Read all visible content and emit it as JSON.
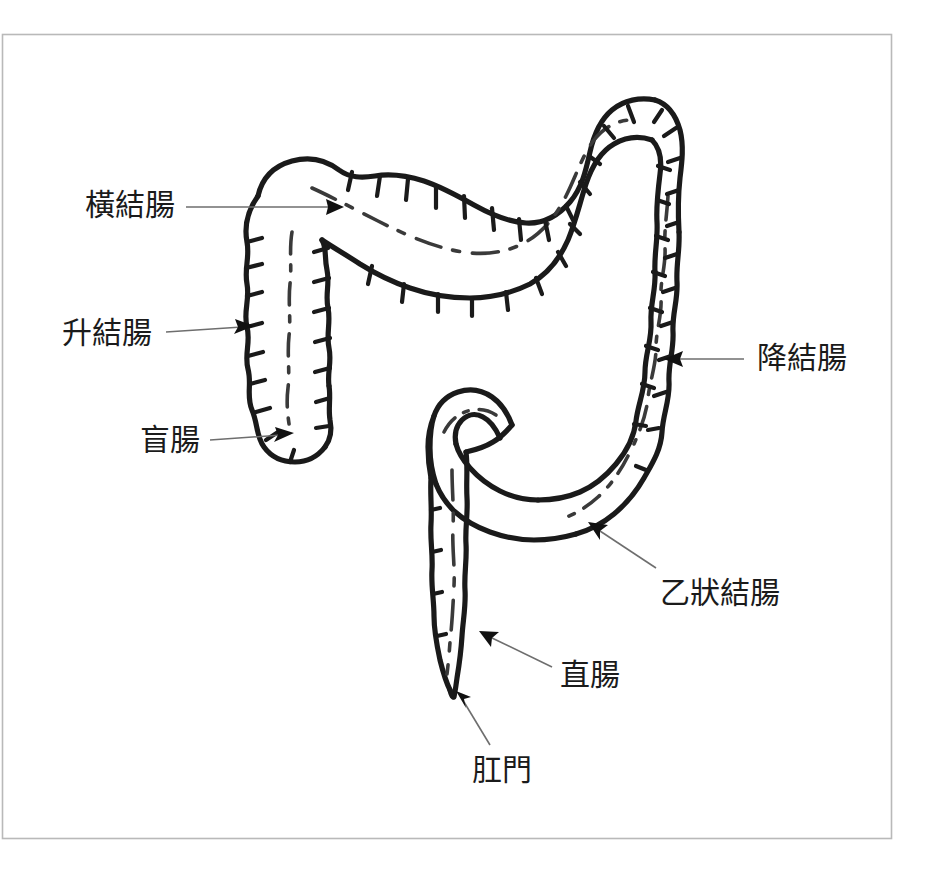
{
  "figure": {
    "title_visible": false,
    "background_color": "#ffffff",
    "frame": {
      "color": "#b9b9b9",
      "x": 2,
      "y": 34,
      "width": 889,
      "height": 804
    },
    "line_color": "#1a1a1a",
    "leader_color": "#6e6e6e",
    "text_color": "#1b1b1b"
  },
  "labels": [
    {
      "id": "transverse-colon",
      "text": "橫結腸",
      "x": 85,
      "y": 190,
      "arrow_from": [
        186,
        207
      ],
      "arrow_to": [
        340,
        207
      ]
    },
    {
      "id": "ascending-colon",
      "text": "升結腸",
      "x": 62,
      "y": 318,
      "arrow_from": [
        166,
        331
      ],
      "arrow_to": [
        248,
        326
      ]
    },
    {
      "id": "cecum",
      "text": "盲腸",
      "x": 140,
      "y": 425,
      "arrow_from": [
        210,
        440
      ],
      "arrow_to": [
        288,
        434
      ]
    },
    {
      "id": "descending-colon",
      "text": "降結腸",
      "x": 757,
      "y": 343,
      "arrow_from": [
        744,
        359
      ],
      "arrow_to": [
        668,
        359
      ]
    },
    {
      "id": "sigmoid-colon",
      "text": "乙狀結腸",
      "x": 660,
      "y": 578,
      "arrow_from": [
        655,
        568
      ],
      "arrow_to": [
        589,
        523
      ]
    },
    {
      "id": "rectum",
      "text": "直腸",
      "x": 560,
      "y": 660,
      "arrow_from": [
        552,
        667
      ],
      "arrow_to": [
        482,
        632
      ]
    },
    {
      "id": "anus",
      "text": "肛門",
      "x": 472,
      "y": 755,
      "arrow_from": [
        490,
        745
      ],
      "arrow_to": [
        458,
        695
      ]
    }
  ],
  "anatomy_parts": [
    {
      "id": "cecum",
      "label": "盲腸",
      "english": "cecum"
    },
    {
      "id": "ascending-colon",
      "label": "升結腸",
      "english": "ascending colon"
    },
    {
      "id": "transverse-colon",
      "label": "橫結腸",
      "english": "transverse colon"
    },
    {
      "id": "descending-colon",
      "label": "降結腸",
      "english": "descending colon"
    },
    {
      "id": "sigmoid-colon",
      "label": "乙狀結腸",
      "english": "sigmoid colon"
    },
    {
      "id": "rectum",
      "label": "直腸",
      "english": "rectum"
    },
    {
      "id": "anus",
      "label": "肛門",
      "english": "anus"
    }
  ]
}
